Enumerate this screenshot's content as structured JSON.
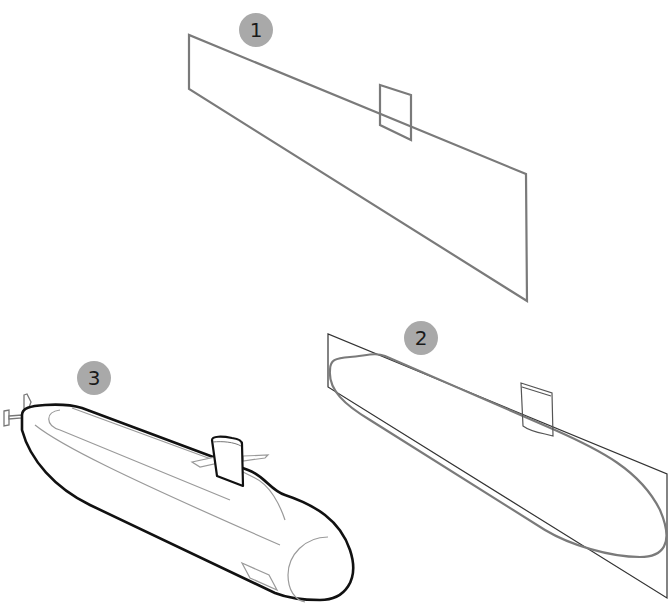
{
  "diagram": {
    "steps": [
      {
        "number": "1",
        "label": "Step 1",
        "description": "Perspective box outline with conning tower box"
      },
      {
        "number": "2",
        "label": "Step 2",
        "description": "Rounded hull drawn inside the box"
      },
      {
        "number": "3",
        "label": "Step 3",
        "description": "Final submarine with details"
      }
    ],
    "colors": {
      "marker_fill": "#a9a9a9",
      "guide_stroke": "#7a7a7a",
      "frame_stroke": "#333333",
      "final_outline": "#111111",
      "detail_stroke": "#9a9a9a"
    }
  }
}
